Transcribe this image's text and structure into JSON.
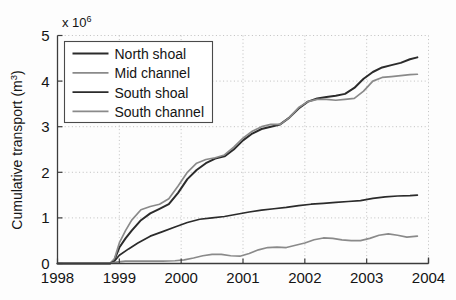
{
  "figure": {
    "background_color": "#fdfdfd",
    "axis_color": "#3c3c3c",
    "grid_color": "#b9b9b9"
  },
  "axes": {
    "exponent_prefix": "x 10",
    "exponent_power": "6",
    "ylabel_main": "Cumulative transport (m",
    "ylabel_sup": "3",
    "ylabel_close": ")",
    "xlabel": ""
  },
  "legend": {
    "position": "top-left-inside",
    "items": [
      {
        "label": "North shoal",
        "color": "#2b2b2b",
        "width": 2.0
      },
      {
        "label": "Mid channel",
        "color": "#8a8a8a",
        "width": 1.7
      },
      {
        "label": "South shoal",
        "color": "#2b2b2b",
        "width": 1.7
      },
      {
        "label": "South channel",
        "color": "#8a8a8a",
        "width": 1.7
      }
    ]
  },
  "chart_data": {
    "type": "line",
    "title": "",
    "xlabel": "",
    "ylabel": "Cumulative transport (m^3)",
    "y_exponent": 1000000,
    "y_exponent_label": "x 10^6",
    "xlim": [
      1998,
      2004
    ],
    "ylim": [
      0,
      5
    ],
    "xticks": [
      1998,
      1999,
      2000,
      2001,
      2002,
      2003,
      2004
    ],
    "xticklabels": [
      "1998",
      "1999",
      "2000",
      "2001",
      "2002",
      "2003",
      "2004"
    ],
    "yticks": [
      0,
      1,
      2,
      3,
      4,
      5
    ],
    "yticklabels": [
      "0",
      "1",
      "2",
      "3",
      "4",
      "5"
    ],
    "grid": true,
    "grid_style": "dotted",
    "legend_position": "upper left",
    "series": [
      {
        "name": "North shoal",
        "color": "#2b2b2b",
        "x": [
          1998.0,
          1998.3,
          1998.6,
          1998.85,
          1998.92,
          1999.0,
          1999.1,
          1999.2,
          1999.35,
          1999.5,
          1999.65,
          1999.8,
          1999.95,
          2000.1,
          2000.25,
          2000.4,
          2000.55,
          2000.7,
          2000.85,
          2001.0,
          2001.15,
          2001.3,
          2001.45,
          2001.6,
          2001.75,
          2001.9,
          2002.05,
          2002.2,
          2002.35,
          2002.5,
          2002.65,
          2002.8,
          2002.95,
          2003.1,
          2003.25,
          2003.4,
          2003.55,
          2003.7,
          2003.82
        ],
        "y": [
          0.0,
          0.0,
          0.0,
          0.0,
          0.08,
          0.35,
          0.55,
          0.72,
          0.95,
          1.1,
          1.2,
          1.3,
          1.55,
          1.85,
          2.05,
          2.2,
          2.3,
          2.35,
          2.5,
          2.7,
          2.85,
          2.95,
          3.0,
          3.05,
          3.2,
          3.4,
          3.55,
          3.62,
          3.65,
          3.68,
          3.72,
          3.85,
          4.05,
          4.2,
          4.3,
          4.35,
          4.4,
          4.48,
          4.52
        ]
      },
      {
        "name": "Mid channel",
        "color": "#8a8a8a",
        "x": [
          1998.0,
          1998.3,
          1998.6,
          1998.85,
          1998.92,
          1999.0,
          1999.1,
          1999.2,
          1999.35,
          1999.5,
          1999.65,
          1999.8,
          1999.95,
          2000.1,
          2000.25,
          2000.4,
          2000.55,
          2000.7,
          2000.85,
          2001.0,
          2001.15,
          2001.3,
          2001.45,
          2001.6,
          2001.75,
          2001.9,
          2002.05,
          2002.2,
          2002.35,
          2002.5,
          2002.65,
          2002.8,
          2002.95,
          2003.1,
          2003.25,
          2003.4,
          2003.55,
          2003.7,
          2003.82
        ],
        "y": [
          0.0,
          0.0,
          0.0,
          0.0,
          0.1,
          0.45,
          0.72,
          0.95,
          1.18,
          1.25,
          1.3,
          1.42,
          1.7,
          2.0,
          2.2,
          2.28,
          2.32,
          2.38,
          2.55,
          2.75,
          2.9,
          3.0,
          3.05,
          3.05,
          3.2,
          3.42,
          3.55,
          3.6,
          3.6,
          3.58,
          3.6,
          3.62,
          3.78,
          4.0,
          4.08,
          4.1,
          4.12,
          4.14,
          4.15
        ]
      },
      {
        "name": "South shoal",
        "color": "#2b2b2b",
        "x": [
          1998.0,
          1998.3,
          1998.6,
          1998.85,
          1998.92,
          1999.0,
          1999.15,
          1999.3,
          1999.5,
          1999.7,
          1999.9,
          2000.1,
          2000.3,
          2000.5,
          2000.7,
          2000.9,
          2001.1,
          2001.3,
          2001.5,
          2001.7,
          2001.9,
          2002.1,
          2002.3,
          2002.5,
          2002.7,
          2002.9,
          2003.1,
          2003.3,
          2003.5,
          2003.7,
          2003.82
        ],
        "y": [
          0.0,
          0.0,
          0.0,
          0.0,
          0.05,
          0.18,
          0.32,
          0.45,
          0.6,
          0.7,
          0.8,
          0.9,
          0.97,
          1.0,
          1.03,
          1.08,
          1.13,
          1.17,
          1.2,
          1.23,
          1.27,
          1.3,
          1.32,
          1.34,
          1.36,
          1.38,
          1.43,
          1.46,
          1.48,
          1.49,
          1.5
        ]
      },
      {
        "name": "South channel",
        "color": "#8a8a8a",
        "x": [
          1998.0,
          1998.3,
          1998.6,
          1998.85,
          1998.95,
          1999.1,
          1999.3,
          1999.5,
          1999.7,
          1999.9,
          2000.05,
          2000.2,
          2000.35,
          2000.5,
          2000.65,
          2000.8,
          2000.95,
          2001.1,
          2001.25,
          2001.4,
          2001.55,
          2001.7,
          2001.85,
          2002.0,
          2002.15,
          2002.3,
          2002.45,
          2002.6,
          2002.75,
          2002.9,
          2003.05,
          2003.2,
          2003.35,
          2003.5,
          2003.65,
          2003.82
        ],
        "y": [
          0.0,
          0.0,
          0.0,
          0.0,
          0.03,
          0.05,
          0.05,
          0.05,
          0.05,
          0.06,
          0.08,
          0.12,
          0.17,
          0.2,
          0.2,
          0.17,
          0.16,
          0.22,
          0.3,
          0.35,
          0.36,
          0.35,
          0.4,
          0.45,
          0.52,
          0.56,
          0.55,
          0.52,
          0.5,
          0.5,
          0.55,
          0.62,
          0.65,
          0.62,
          0.58,
          0.6
        ]
      }
    ]
  }
}
